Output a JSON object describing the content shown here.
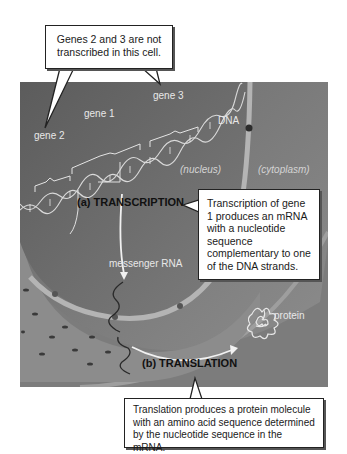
{
  "figure": {
    "callouts": {
      "top": "Genes 2 and 3 are not transcribed in this cell.",
      "right": "Transcription of gene 1 produces an mRNA with a nucleotide sequence complementary to one of the DNA strands.",
      "bottom": "Translation produces a protein molecule with an amino acid sequence determined by the nucleotide sequence in the mRNA."
    },
    "labels": {
      "gene1": "gene 1",
      "gene2": "gene 2",
      "gene3": "gene 3",
      "dna": "DNA",
      "nucleus": "(nucleus)",
      "cytoplasm": "(cytoplasm)",
      "mrna": "messenger RNA",
      "protein": "protein"
    },
    "steps": {
      "transcription": "(a) TRANSCRIPTION",
      "translation": "(b) TRANSLATION"
    },
    "colors": {
      "background": "#ffffff",
      "nucleus": "#6e6e6e",
      "cytoplasm": "#8a8a8a",
      "envelope": "#b5b5b5",
      "label": "#e8e8e8"
    }
  }
}
